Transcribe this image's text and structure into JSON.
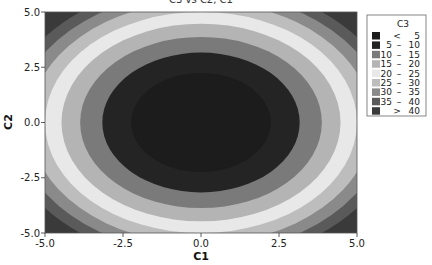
{
  "chart_data": {
    "type": "contour",
    "title": "C3 vs C2, C1",
    "xlabel": "C1",
    "ylabel": "C2",
    "xlim": [
      -5.0,
      5.0
    ],
    "ylim": [
      -5.0,
      5.0
    ],
    "x_ticks": [
      "-5.0",
      "-2.5",
      "0.0",
      "2.5",
      "5.0"
    ],
    "x_tick_values": [
      -5.0,
      -2.5,
      0.0,
      2.5,
      5.0
    ],
    "y_ticks": [
      "-5.0",
      "-2.5",
      "0.0",
      "2.5",
      "5.0"
    ],
    "y_tick_values": [
      -5.0,
      -2.5,
      0.0,
      2.5,
      5.0
    ],
    "grid": false,
    "function_estimate": "C3 = C1^2 + C2^2",
    "levels": [
      5,
      10,
      15,
      20,
      25,
      30,
      35,
      40
    ],
    "legend": {
      "title": "C3",
      "position": "right",
      "entries": [
        {
          "label_lo": "<",
          "label_hi": "5",
          "color": "#1c1c1c"
        },
        {
          "label_lo": "5",
          "label_hi": "10",
          "color": "#242424"
        },
        {
          "label_lo": "10",
          "label_hi": "15",
          "color": "#7a7a7a"
        },
        {
          "label_lo": "15",
          "label_hi": "20",
          "color": "#b4b4b4"
        },
        {
          "label_lo": "20",
          "label_hi": "25",
          "color": "#e8e8e8"
        },
        {
          "label_lo": "25",
          "label_hi": "30",
          "color": "#bdbdbd"
        },
        {
          "label_lo": "30",
          "label_hi": "35",
          "color": "#8a8a8a"
        },
        {
          "label_lo": "35",
          "label_hi": "40",
          "color": "#5a5a5a"
        },
        {
          "label_lo": ">",
          "label_hi": "40",
          "color": "#3a3a3a"
        }
      ]
    }
  }
}
